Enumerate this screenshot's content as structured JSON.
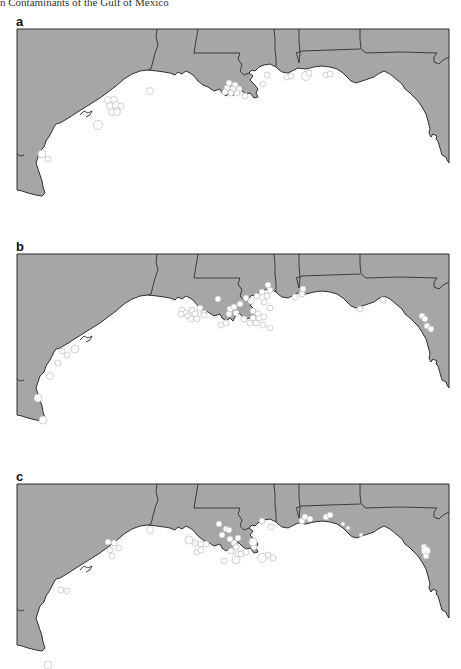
{
  "header": {
    "text": "n Contaminants of the Gulf of Mexico"
  },
  "colors": {
    "land": "#a6a6a6",
    "border": "#2f2f2f",
    "site_fill": "#ffffff",
    "water": "#ffffff"
  },
  "panels": [
    {
      "label": "a",
      "top": 29,
      "sites": [
        [
          150,
          62,
          3.5
        ],
        [
          108,
          71,
          3.5
        ],
        [
          114,
          71,
          3.5
        ],
        [
          110,
          77,
          3.5
        ],
        [
          116,
          76,
          3.5
        ],
        [
          121,
          77,
          3
        ],
        [
          112,
          83,
          3.5
        ],
        [
          117,
          83,
          3.5
        ],
        [
          98,
          96,
          4.5
        ],
        [
          42,
          125,
          4
        ],
        [
          48,
          130,
          3
        ],
        [
          229,
          54,
          3
        ],
        [
          235,
          56,
          3
        ],
        [
          227,
          59,
          3
        ],
        [
          233,
          60,
          3
        ],
        [
          239,
          60,
          3
        ],
        [
          225,
          63,
          3
        ],
        [
          231,
          64,
          3
        ],
        [
          237,
          64,
          3
        ],
        [
          245,
          67,
          3
        ],
        [
          263,
          55,
          3
        ],
        [
          267,
          46,
          3
        ],
        [
          287,
          48,
          3
        ],
        [
          291,
          47,
          3
        ],
        [
          306,
          47,
          4.5
        ],
        [
          309,
          44,
          3
        ],
        [
          326,
          46,
          3
        ],
        [
          330,
          45,
          3
        ]
      ]
    },
    {
      "label": "b",
      "top": 254,
      "sites": [
        [
          218,
          45,
          3
        ],
        [
          182,
          56,
          3
        ],
        [
          186,
          59,
          3
        ],
        [
          192,
          56,
          3
        ],
        [
          200,
          54,
          3
        ],
        [
          204,
          59,
          3
        ],
        [
          181,
          60,
          3
        ],
        [
          188,
          62,
          3
        ],
        [
          195,
          60,
          3
        ],
        [
          191,
          65,
          3
        ],
        [
          197,
          65,
          3
        ],
        [
          204,
          61,
          3
        ],
        [
          230,
          55,
          3
        ],
        [
          234,
          53,
          3
        ],
        [
          236,
          59,
          3
        ],
        [
          229,
          60,
          3
        ],
        [
          240,
          50,
          3
        ],
        [
          246,
          44,
          3
        ],
        [
          251,
          47,
          3
        ],
        [
          257,
          42,
          3
        ],
        [
          262,
          38,
          3
        ],
        [
          270,
          36,
          3
        ],
        [
          264,
          48,
          3
        ],
        [
          226,
          69,
          3
        ],
        [
          221,
          71,
          3
        ],
        [
          244,
          65,
          3
        ],
        [
          253,
          57,
          3
        ],
        [
          258,
          60,
          3
        ],
        [
          253,
          64,
          3
        ],
        [
          259,
          64,
          3
        ],
        [
          264,
          63,
          3
        ],
        [
          250,
          69,
          3
        ],
        [
          256,
          69,
          3
        ],
        [
          263,
          71,
          3
        ],
        [
          270,
          74,
          3
        ],
        [
          270,
          54,
          3
        ],
        [
          267,
          42,
          3
        ],
        [
          268,
          31,
          3
        ],
        [
          295,
          43,
          3
        ],
        [
          302,
          40,
          3
        ],
        [
          303,
          35,
          3
        ],
        [
          360,
          55,
          3
        ],
        [
          383,
          46,
          3
        ],
        [
          422,
          62,
          3
        ],
        [
          425,
          65,
          3
        ],
        [
          427,
          72,
          3
        ],
        [
          431,
          75,
          3
        ],
        [
          62,
          97,
          3
        ],
        [
          67,
          101,
          3
        ],
        [
          75,
          95,
          4
        ],
        [
          58,
          109,
          3
        ],
        [
          50,
          122,
          3.5
        ],
        [
          38,
          144,
          4
        ],
        [
          43,
          166,
          4
        ]
      ]
    },
    {
      "label": "c",
      "top": 484,
      "sites": [
        [
          150,
          46,
          3.5
        ],
        [
          108,
          58,
          3
        ],
        [
          114,
          59,
          3
        ],
        [
          119,
          64,
          3
        ],
        [
          110,
          66,
          3
        ],
        [
          112,
          72,
          3
        ],
        [
          61,
          106,
          3
        ],
        [
          67,
          107,
          3
        ],
        [
          48,
          181,
          4
        ],
        [
          219,
          40,
          3
        ],
        [
          226,
          45,
          3
        ],
        [
          229,
          46,
          3
        ],
        [
          222,
          51,
          3
        ],
        [
          189,
          56,
          4
        ],
        [
          195,
          59,
          3
        ],
        [
          201,
          60,
          3
        ],
        [
          206,
          60,
          3
        ],
        [
          197,
          68,
          3
        ],
        [
          201,
          66,
          3
        ],
        [
          230,
          55,
          3
        ],
        [
          234,
          59,
          3
        ],
        [
          238,
          54,
          3
        ],
        [
          236,
          63,
          3
        ],
        [
          231,
          67,
          3
        ],
        [
          238,
          70,
          3
        ],
        [
          224,
          77,
          3
        ],
        [
          241,
          70,
          3
        ],
        [
          246,
          68,
          3
        ],
        [
          254,
          63,
          3
        ],
        [
          253,
          58,
          4
        ],
        [
          236,
          76,
          4
        ],
        [
          262,
          74,
          4.5
        ],
        [
          268,
          71,
          3
        ],
        [
          273,
          74,
          3
        ],
        [
          262,
          37,
          3
        ],
        [
          271,
          43,
          3
        ],
        [
          302,
          37,
          3
        ],
        [
          305,
          33,
          3
        ],
        [
          310,
          35,
          3
        ],
        [
          326,
          33,
          3
        ],
        [
          330,
          31,
          3
        ],
        [
          343,
          40,
          2
        ],
        [
          348,
          44,
          2
        ],
        [
          361,
          51,
          2
        ],
        [
          424,
          63,
          3
        ],
        [
          426,
          67,
          4.5
        ],
        [
          426,
          72,
          3
        ]
      ]
    }
  ]
}
